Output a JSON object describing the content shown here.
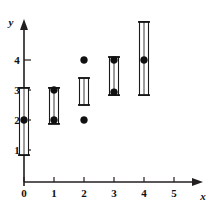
{
  "chart_data": {
    "type": "bar",
    "title": "",
    "subtitle": "",
    "xlabel": "x",
    "ylabel": "y",
    "xlim": [
      -0.35,
      5.7
    ],
    "ylim": [
      0,
      5.9
    ],
    "grid": false,
    "legend": null,
    "x_ticks": [
      0,
      1,
      2,
      3,
      4,
      5
    ],
    "x_tick_labels": [
      "0",
      "1",
      "2",
      "3",
      "4",
      "5"
    ],
    "y_ticks": [
      1,
      2,
      3,
      4
    ],
    "y_tick_labels": [
      "1",
      "2",
      "3",
      "4"
    ],
    "categories": [
      "0",
      "1",
      "2",
      "3",
      "4"
    ],
    "series": [
      {
        "name": "interval-low",
        "values": [
          0.83,
          1.87,
          2.5,
          2.83,
          2.83
        ]
      },
      {
        "name": "interval-high",
        "values": [
          3.07,
          3.07,
          3.4,
          4.1,
          5.27
        ]
      }
    ],
    "intervals": [
      {
        "x": 0,
        "low": 0.83,
        "high": 3.07
      },
      {
        "x": 1,
        "low": 1.87,
        "high": 3.07
      },
      {
        "x": 2,
        "low": 2.5,
        "high": 3.4
      },
      {
        "x": 3,
        "low": 2.83,
        "high": 4.1
      },
      {
        "x": 4,
        "low": 2.83,
        "high": 5.27
      }
    ],
    "points": [
      {
        "x": 0,
        "y": 2
      },
      {
        "x": 1,
        "y": 2
      },
      {
        "x": 1,
        "y": 3
      },
      {
        "x": 2,
        "y": 2
      },
      {
        "x": 2,
        "y": 4
      },
      {
        "x": 3,
        "y": 2.93
      },
      {
        "x": 3,
        "y": 4
      },
      {
        "x": 4,
        "y": 4
      }
    ],
    "colors": {
      "axis": "#231f20",
      "bar_fill": "#ffffff",
      "bar_stroke": "#1a1a1a",
      "point": "#111111",
      "background": "#ffffff"
    }
  },
  "axes": {
    "y_axis_name": "y",
    "x_axis_name": "x"
  }
}
